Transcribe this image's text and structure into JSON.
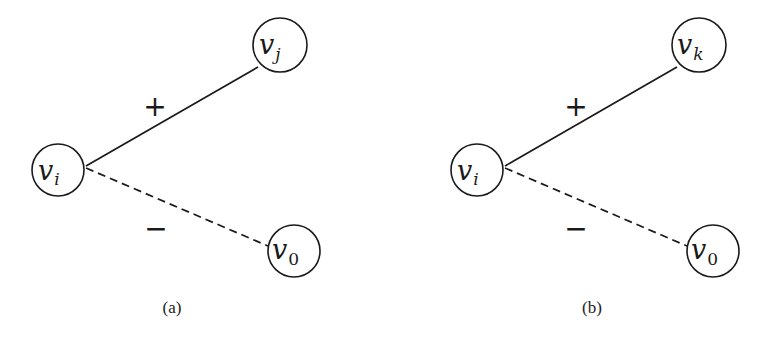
{
  "panels": [
    {
      "id": "a",
      "caption": "(a)",
      "nodes": {
        "center": {
          "main": "v",
          "sub": "i"
        },
        "top": {
          "main": "v",
          "sub": "j"
        },
        "bottom": {
          "main": "v",
          "sub": "0"
        }
      },
      "edges": {
        "positive": {
          "sign": "+",
          "style": "solid",
          "from": "v_i",
          "to": "v_j"
        },
        "negative": {
          "sign": "−",
          "style": "dashed",
          "from": "v_i",
          "to": "v_0"
        }
      }
    },
    {
      "id": "b",
      "caption": "(b)",
      "nodes": {
        "center": {
          "main": "v",
          "sub": "i"
        },
        "top": {
          "main": "v",
          "sub": "k"
        },
        "bottom": {
          "main": "v",
          "sub": "0"
        }
      },
      "edges": {
        "positive": {
          "sign": "+",
          "style": "solid",
          "from": "v_i",
          "to": "v_k"
        },
        "negative": {
          "sign": "−",
          "style": "dashed",
          "from": "v_i",
          "to": "v_0"
        }
      }
    }
  ],
  "colors": {
    "stroke": "#1a1a1a",
    "background": "#ffffff"
  }
}
